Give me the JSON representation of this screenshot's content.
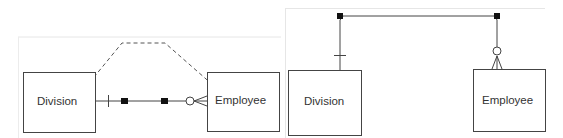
{
  "diagrams": [
    {
      "name": "left-diagram",
      "entities": [
        {
          "id": "division",
          "label": "Division"
        },
        {
          "id": "employee",
          "label": "Employee"
        }
      ],
      "relationship": {
        "from": "division",
        "to": "employee",
        "from_cardinality": "one",
        "to_cardinality": "zero-or-many",
        "routing": "straight-with-dashed-preview"
      }
    },
    {
      "name": "right-diagram",
      "entities": [
        {
          "id": "division",
          "label": "Division"
        },
        {
          "id": "employee",
          "label": "Employee"
        }
      ],
      "relationship": {
        "from": "division",
        "to": "employee",
        "from_cardinality": "one",
        "to_cardinality": "zero-or-many",
        "routing": "orthogonal-over-top"
      }
    }
  ],
  "colors": {
    "line": "#444444",
    "panel_border": "#e6e6e6",
    "handle": "#111111",
    "text": "#333333"
  }
}
